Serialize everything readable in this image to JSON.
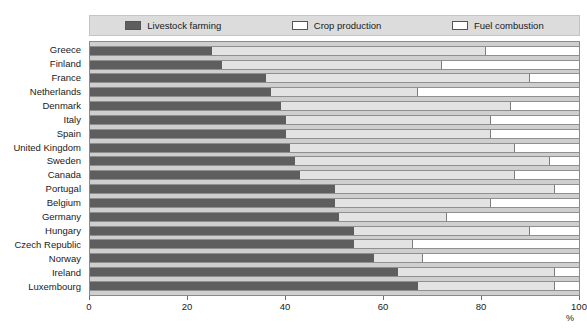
{
  "legend": {
    "items": [
      {
        "label": "Livestock farming",
        "icon": "swatch-filled-dark",
        "color": "#5e5e5e"
      },
      {
        "label": "Crop production",
        "icon": "swatch-outline",
        "color": "#e3e3e3"
      },
      {
        "label": "Fuel combustion",
        "icon": "swatch-outline",
        "color": "#ffffff"
      }
    ]
  },
  "axis": {
    "x_unit": "%",
    "x_ticks": [
      0,
      20,
      40,
      60,
      80,
      100
    ]
  },
  "chart_data": {
    "type": "bar",
    "orientation": "horizontal",
    "stacked": true,
    "normalized": true,
    "title": "",
    "subtitle": "",
    "xlabel": "%",
    "ylabel": "",
    "xlim": [
      0,
      100
    ],
    "grid": false,
    "legend_position": "top",
    "categories": [
      "Greece",
      "Finland",
      "France",
      "Netherlands",
      "Denmark",
      "Italy",
      "Spain",
      "United Kingdom",
      "Sweden",
      "Canada",
      "Portugal",
      "Belgium",
      "Germany",
      "Hungary",
      "Czech Republic",
      "Norway",
      "Ireland",
      "Luxembourg"
    ],
    "series": [
      {
        "name": "Livestock farming",
        "color": "#5e5e5e",
        "values": [
          25,
          27,
          36,
          37,
          39,
          40,
          40,
          41,
          42,
          43,
          50,
          50,
          51,
          54,
          54,
          58,
          63,
          67
        ]
      },
      {
        "name": "Crop production",
        "color": "#e3e3e3",
        "values": [
          56,
          45,
          54,
          30,
          47,
          42,
          42,
          46,
          52,
          44,
          45,
          32,
          22,
          36,
          12,
          10,
          32,
          28
        ]
      },
      {
        "name": "Fuel combustion",
        "color": "#ffffff",
        "values": [
          19,
          28,
          10,
          33,
          14,
          18,
          18,
          13,
          6,
          13,
          5,
          18,
          27,
          10,
          34,
          32,
          5,
          5
        ]
      }
    ],
    "cumulative_boundaries": [
      {
        "category": "Greece",
        "livestock_end": 25,
        "crop_end": 81
      },
      {
        "category": "Finland",
        "livestock_end": 27,
        "crop_end": 72
      },
      {
        "category": "France",
        "livestock_end": 36,
        "crop_end": 90
      },
      {
        "category": "Netherlands",
        "livestock_end": 37,
        "crop_end": 67
      },
      {
        "category": "Denmark",
        "livestock_end": 39,
        "crop_end": 86
      },
      {
        "category": "Italy",
        "livestock_end": 40,
        "crop_end": 82
      },
      {
        "category": "Spain",
        "livestock_end": 40,
        "crop_end": 82
      },
      {
        "category": "United Kingdom",
        "livestock_end": 41,
        "crop_end": 87
      },
      {
        "category": "Sweden",
        "livestock_end": 42,
        "crop_end": 94
      },
      {
        "category": "Canada",
        "livestock_end": 43,
        "crop_end": 87
      },
      {
        "category": "Portugal",
        "livestock_end": 50,
        "crop_end": 95
      },
      {
        "category": "Belgium",
        "livestock_end": 50,
        "crop_end": 82
      },
      {
        "category": "Germany",
        "livestock_end": 51,
        "crop_end": 73
      },
      {
        "category": "Hungary",
        "livestock_end": 54,
        "crop_end": 90
      },
      {
        "category": "Czech Republic",
        "livestock_end": 54,
        "crop_end": 66
      },
      {
        "category": "Norway",
        "livestock_end": 58,
        "crop_end": 68
      },
      {
        "category": "Ireland",
        "livestock_end": 63,
        "crop_end": 95
      },
      {
        "category": "Luxembourg",
        "livestock_end": 67,
        "crop_end": 95
      }
    ]
  }
}
